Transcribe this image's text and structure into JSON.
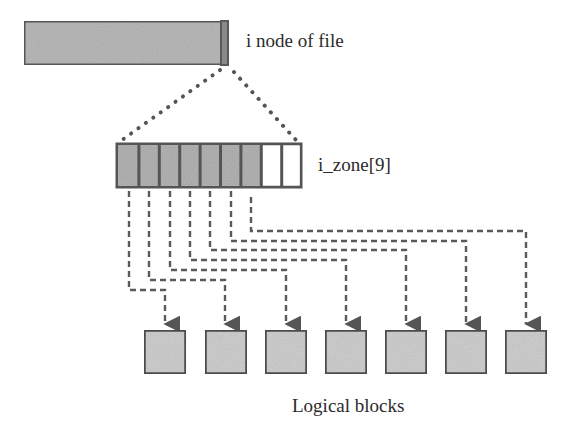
{
  "diagram": {
    "inode": {
      "label": "i node of file",
      "fill": "#b9b9b9",
      "border": "#5a5a5a"
    },
    "izone": {
      "label": "i_zone[9]",
      "cell_count": 9,
      "used_cells": 7,
      "used_fill": "#b3b3b3",
      "empty_fill": "#ffffff",
      "border": "#555555"
    },
    "logical_blocks": {
      "label": "Logical blocks",
      "count": 7,
      "fill": "#cfcfcf",
      "border": "#4f4f4f"
    },
    "connectors": {
      "style": "dashed",
      "color": "#5a5a5a",
      "from_cells": [
        1,
        2,
        3,
        4,
        5,
        6,
        7
      ],
      "to_blocks": [
        1,
        2,
        3,
        4,
        5,
        6,
        7
      ]
    },
    "expansion_lines": {
      "style": "dotted",
      "color": "#555555"
    }
  }
}
